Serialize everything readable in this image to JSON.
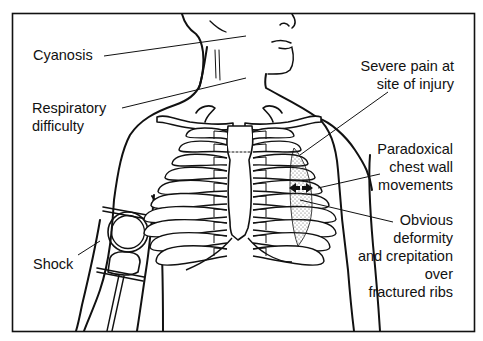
{
  "figure": {
    "colors": {
      "line": "#111111",
      "background": "#ffffff",
      "stipple": "#555555"
    }
  },
  "labels": {
    "cyanosis": "Cyanosis",
    "respiratory": "Respiratory\ndifficulty",
    "shock": "Shock",
    "pain": "Severe pain at\nsite of injury",
    "paradoxical": "Paradoxical\nchest wall\nmovements",
    "deformity": "Obvious\ndeformity\nand crepitation\nover\nfractured ribs"
  },
  "icons": {
    "flail_arrows": "double-headed-arrow",
    "bp_cuff": "sphygmomanometer-gauge"
  }
}
